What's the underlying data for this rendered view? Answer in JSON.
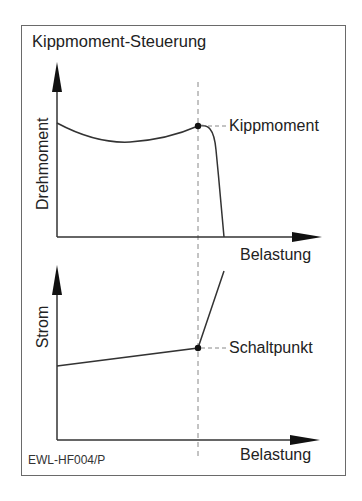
{
  "title": "Kippmoment-Steuerung",
  "figure_code": "EWL-HF004/P",
  "top_chart": {
    "ylabel": "Drehmoment",
    "xlabel": "Belastung",
    "annotation": "Kippmoment"
  },
  "bottom_chart": {
    "ylabel": "Strom",
    "xlabel": "Belastung",
    "annotation": "Schaltpunkt"
  },
  "colors": {
    "line": "#333333",
    "dashed": "#888888",
    "frame": "#6a6a6a"
  }
}
